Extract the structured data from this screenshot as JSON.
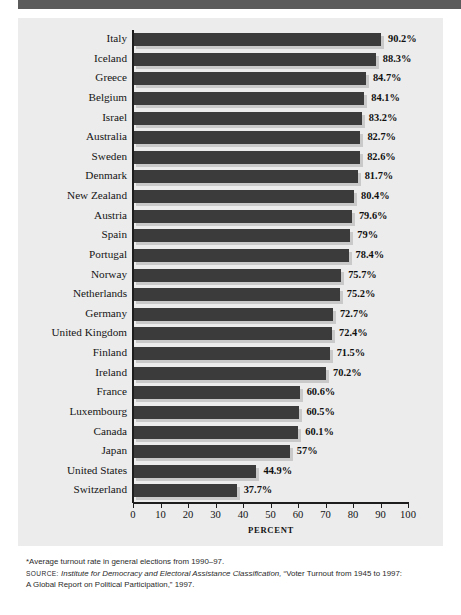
{
  "chart_data": {
    "type": "bar",
    "orientation": "horizontal",
    "title": "",
    "xlabel": "PERCENT",
    "ylabel": "",
    "xlim": [
      0,
      100
    ],
    "xticks": [
      0,
      10,
      20,
      30,
      40,
      50,
      60,
      70,
      80,
      90,
      100
    ],
    "grid": false,
    "legend": false,
    "categories": [
      "Italy",
      "Iceland",
      "Greece",
      "Belgium",
      "Israel",
      "Australia",
      "Sweden",
      "Denmark",
      "New Zealand",
      "Austria",
      "Spain",
      "Portugal",
      "Norway",
      "Netherlands",
      "Germany",
      "United Kingdom",
      "Finland",
      "Ireland",
      "France",
      "Luxembourg",
      "Canada",
      "Japan",
      "United States",
      "Switzerland"
    ],
    "values": [
      90.2,
      88.3,
      84.7,
      84.1,
      83.2,
      82.7,
      82.6,
      81.7,
      80.4,
      79.6,
      79,
      78.4,
      75.7,
      75.2,
      72.7,
      72.4,
      71.5,
      70.2,
      60.6,
      60.5,
      60.1,
      57,
      44.9,
      37.7
    ],
    "value_labels": [
      "90.2%",
      "88.3%",
      "84.7%",
      "84.1%",
      "83.2%",
      "82.7%",
      "82.6%",
      "81.7%",
      "80.4%",
      "79.6%",
      "79%",
      "78.4%",
      "75.7%",
      "75.2%",
      "72.7%",
      "72.4%",
      "71.5%",
      "70.2%",
      "60.6%",
      "60.5%",
      "60.1%",
      "57%",
      "44.9%",
      "37.7%"
    ],
    "bar_color": "#3b3b3b",
    "shadow_color": "#c9c9c9",
    "panel_color": "#ececec"
  },
  "notes": {
    "footnote": "*Average turnout rate in general elections from 1990–97.",
    "source_label": "Source:",
    "source_italic": "Institute for Democracy and Electoral Assistance Classification,",
    "source_rest": "“Voter Turnout from 1945 to 1997:",
    "source_line2": "A Global Report on Political Participation,” 1997."
  }
}
